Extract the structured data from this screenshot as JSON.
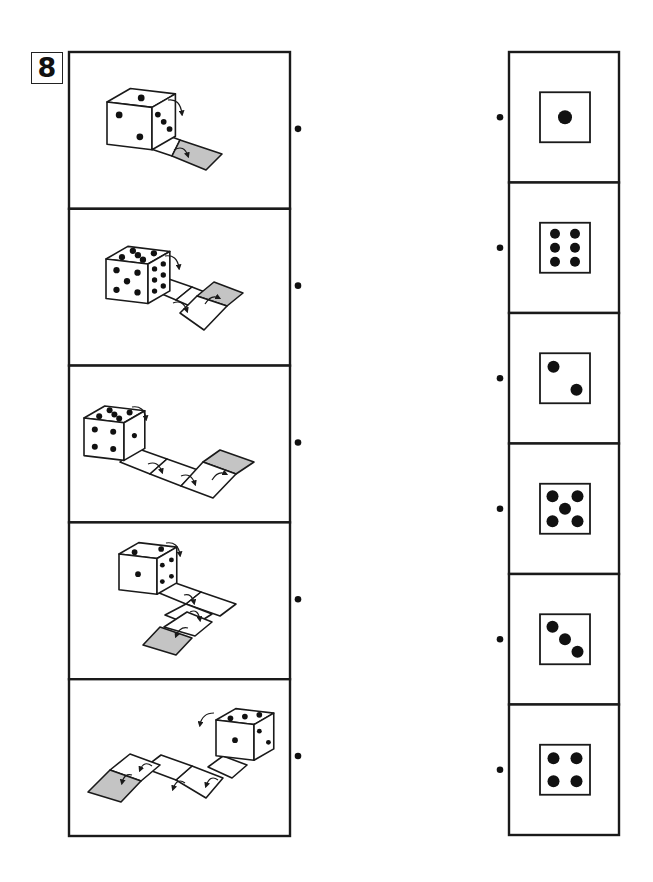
{
  "puzzle": {
    "number_label": "8",
    "task": "Match each die-rolling path (left) to the face that ends up on top on the shaded tile (right)",
    "colors": {
      "line": "#1a1a1a",
      "shaded_tile": "#c4c4c4",
      "pip": "#111111",
      "background": "#ffffff"
    }
  },
  "left_panels": [
    {
      "id": "path-1",
      "top_face": 1,
      "front_face": 2,
      "right_face": 3,
      "tile_count": 2,
      "rolls": 1,
      "path": "straight, 1 roll to the right-back"
    },
    {
      "id": "path-2",
      "top_face": 5,
      "front_face": 5,
      "right_face": 6,
      "tile_count": 4,
      "rolls": 2,
      "path": "straight 2 then turn"
    },
    {
      "id": "path-3",
      "top_face": 5,
      "front_face": 4,
      "right_face": 1,
      "tile_count": 5,
      "rolls": 3,
      "path": "straight 3 then turn"
    },
    {
      "id": "path-4",
      "top_face": 2,
      "front_face": 1,
      "right_face": 4,
      "tile_count": 5,
      "rolls": 3,
      "path": "right then down 2 tiles"
    },
    {
      "id": "path-5",
      "top_face": 3,
      "front_face": 1,
      "right_face": 2,
      "tile_count": 6,
      "rolls": 4,
      "path": "left zigzag"
    }
  ],
  "right_options": [
    {
      "id": "face-1",
      "pips": 1
    },
    {
      "id": "face-6",
      "pips": 6
    },
    {
      "id": "face-2",
      "pips": 2
    },
    {
      "id": "face-5",
      "pips": 5
    },
    {
      "id": "face-3",
      "pips": 3
    },
    {
      "id": "face-4",
      "pips": 4
    }
  ],
  "layout": {
    "left_box": {
      "x": 69,
      "y": 52,
      "w": 221,
      "h": 784
    },
    "right_box": {
      "x": 509,
      "y": 52,
      "w": 110,
      "h": 783
    },
    "left_dots_x": 298,
    "right_dots_x": 500
  }
}
